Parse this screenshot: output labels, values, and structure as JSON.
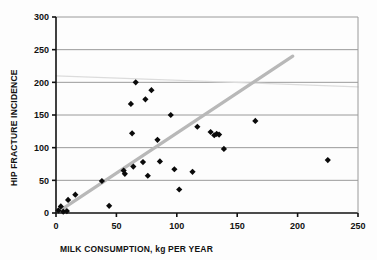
{
  "chart_data": {
    "type": "scatter",
    "title": "",
    "xlabel": "MILK CONSUMPTION, kg PER YEAR",
    "ylabel": "HIP FRACTURE INCIDENCE",
    "xlim": [
      0,
      250
    ],
    "ylim": [
      0,
      300
    ],
    "xticks": [
      0,
      50,
      100,
      150,
      200,
      250
    ],
    "yticks": [
      0,
      50,
      100,
      150,
      200,
      250,
      300
    ],
    "grid": "horizontal",
    "legend": "none",
    "marker": "black-diamond",
    "points": [
      {
        "x": 2,
        "y": 4
      },
      {
        "x": 4,
        "y": 10
      },
      {
        "x": 6,
        "y": 2
      },
      {
        "x": 9,
        "y": 3
      },
      {
        "x": 10,
        "y": 20
      },
      {
        "x": 16,
        "y": 28
      },
      {
        "x": 38,
        "y": 49
      },
      {
        "x": 44,
        "y": 11
      },
      {
        "x": 56,
        "y": 65
      },
      {
        "x": 57,
        "y": 60
      },
      {
        "x": 62,
        "y": 167
      },
      {
        "x": 63,
        "y": 122
      },
      {
        "x": 64,
        "y": 71
      },
      {
        "x": 66,
        "y": 200
      },
      {
        "x": 72,
        "y": 78
      },
      {
        "x": 74,
        "y": 174
      },
      {
        "x": 76,
        "y": 57
      },
      {
        "x": 79,
        "y": 188
      },
      {
        "x": 84,
        "y": 112
      },
      {
        "x": 86,
        "y": 79
      },
      {
        "x": 95,
        "y": 150
      },
      {
        "x": 98,
        "y": 67
      },
      {
        "x": 102,
        "y": 36
      },
      {
        "x": 113,
        "y": 63
      },
      {
        "x": 117,
        "y": 132
      },
      {
        "x": 128,
        "y": 124
      },
      {
        "x": 131,
        "y": 119
      },
      {
        "x": 133,
        "y": 121
      },
      {
        "x": 135,
        "y": 120
      },
      {
        "x": 139,
        "y": 98
      },
      {
        "x": 165,
        "y": 141
      },
      {
        "x": 225,
        "y": 81
      }
    ],
    "trend_lines": [
      {
        "name": "fitted-regression-line",
        "color": "#b8b8b8",
        "width": 3.2,
        "x0": 2,
        "y0": 2,
        "x1": 196,
        "y1": 240
      },
      {
        "name": "reference-line",
        "color": "#dcdcdc",
        "width": 1.2,
        "x0": 0,
        "y0": 210,
        "x1": 250,
        "y1": 193
      }
    ],
    "axis_color": "#111111",
    "grid_color": "#9a9a9a",
    "marker_color": "#0a0a0a"
  }
}
